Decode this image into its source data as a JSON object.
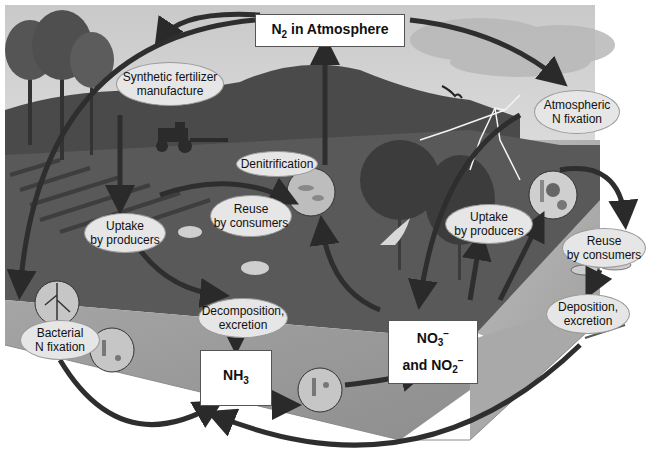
{
  "diagram": {
    "colors": {
      "sky": "#d8d8d8",
      "hill": "#4a4a4a",
      "ground": "#5a5a5a",
      "soil_face": "#9a9a9a",
      "water": "#b4b4b4",
      "arrow": "#2e2e2e",
      "oval_fill": "#e6e6e6",
      "box_fill": "#ffffff"
    },
    "boxes": {
      "n2": {
        "main": "N",
        "sub": "2",
        "rest": " in Atmosphere"
      },
      "nh3": {
        "main": "NH",
        "sub": "3"
      },
      "nitrate": {
        "line1_main": "NO",
        "line1_sub": "3",
        "line1_sup": "−",
        "line2_prefix": "and NO",
        "line2_sub": "2",
        "line2_sup": "−"
      }
    },
    "ovals": {
      "synthetic_fertilizer": {
        "line1": "Synthetic fertilizer",
        "line2": "manufacture"
      },
      "atmospheric_fixation": {
        "line1": "Atmospheric",
        "line2": "N fixation"
      },
      "denitrification": {
        "line1": "Denitrification"
      },
      "reuse_land": {
        "line1": "Reuse",
        "line2": "by consumers"
      },
      "uptake_land": {
        "line1": "Uptake",
        "line2": "by producers"
      },
      "uptake_water": {
        "line1": "Uptake",
        "line2": "by producers"
      },
      "reuse_water": {
        "line1": "Reuse",
        "line2": "by consumers"
      },
      "deposition": {
        "line1": "Deposition,",
        "line2": "excretion"
      },
      "decomposition": {
        "line1": "Decomposition,",
        "line2": "excretion"
      },
      "bacterial_fixation": {
        "line1": "Bacterial",
        "line2": "N fixation"
      }
    },
    "illustrations": [
      "trees",
      "tractor",
      "hill",
      "storm-cloud",
      "lightning",
      "bird",
      "hawk",
      "dogs",
      "forest",
      "fish",
      "fish-skeleton",
      "root-nodules",
      "bacteria-circles",
      "algae-circle"
    ]
  }
}
